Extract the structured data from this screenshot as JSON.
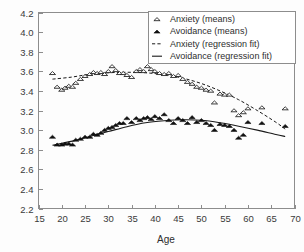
{
  "chart_data": {
    "type": "scatter",
    "title": "",
    "xlabel": "Age",
    "ylabel": "",
    "xlim": [
      15,
      70
    ],
    "ylim": [
      2.2,
      4.2
    ],
    "xticks": [
      15,
      20,
      25,
      30,
      35,
      40,
      45,
      50,
      55,
      60,
      65,
      70
    ],
    "xtick_labels": [
      "15",
      "20",
      "25",
      "30",
      "35",
      "40",
      "45",
      "50",
      "55",
      "60",
      "65",
      "70"
    ],
    "yticks": [
      2.2,
      2.4,
      2.6,
      2.8,
      3.0,
      3.2,
      3.4,
      3.6,
      3.8,
      4.0,
      4.2
    ],
    "ytick_labels": [
      "2.2",
      "2.4",
      "2.6",
      "2.8",
      "3.0",
      "3.2",
      "3.4",
      "3.6",
      "3.8",
      "4.0",
      "4.2"
    ],
    "grid": false,
    "legend_position": "top-right",
    "series": [
      {
        "name": "Anxiety (means)",
        "marker": "open-triangle",
        "style": "markers",
        "x": [
          18,
          19,
          20,
          20.7,
          21.5,
          22.3,
          23,
          24,
          25,
          26,
          26.8,
          27.6,
          28.4,
          29.2,
          30,
          30.8,
          31.6,
          32.4,
          33.2,
          34,
          35,
          36,
          36.8,
          37.6,
          38.4,
          39.2,
          40,
          41,
          42,
          43,
          44,
          45,
          46,
          47,
          48,
          49,
          50,
          51,
          52,
          52.8,
          54,
          55,
          56,
          57,
          58,
          59,
          60,
          63,
          68
        ],
        "y": [
          3.58,
          3.44,
          3.41,
          3.43,
          3.45,
          3.44,
          3.48,
          3.52,
          3.55,
          3.57,
          3.59,
          3.58,
          3.59,
          3.57,
          3.6,
          3.65,
          3.61,
          3.58,
          3.58,
          3.56,
          3.54,
          3.6,
          3.62,
          3.6,
          3.65,
          3.62,
          3.6,
          3.58,
          3.57,
          3.58,
          3.55,
          3.56,
          3.52,
          3.49,
          3.47,
          3.44,
          3.43,
          3.41,
          3.4,
          3.28,
          3.37,
          3.36,
          3.36,
          3.2,
          3.15,
          3.18,
          3.22,
          3.23,
          3.22
        ]
      },
      {
        "name": "Avoidance (means)",
        "marker": "filled-triangle",
        "style": "markers",
        "x": [
          18,
          19,
          20,
          20.7,
          21.5,
          22.3,
          23,
          24,
          25,
          26,
          26.8,
          27.6,
          28.4,
          29.2,
          30,
          30.8,
          31.6,
          32.4,
          33.2,
          34,
          35,
          36,
          36.8,
          37.6,
          38.4,
          39.2,
          40,
          41,
          42,
          43,
          44,
          45,
          46,
          47,
          48,
          49,
          50,
          51,
          52,
          52.8,
          54,
          55,
          56,
          57,
          58,
          59,
          60,
          63,
          68
        ],
        "y": [
          2.93,
          2.85,
          2.85,
          2.86,
          2.86,
          2.85,
          2.9,
          2.91,
          2.93,
          2.93,
          2.96,
          2.95,
          2.97,
          3.0,
          3.02,
          3.03,
          3.05,
          3.07,
          3.07,
          3.12,
          3.08,
          3.12,
          3.1,
          3.12,
          3.13,
          3.11,
          3.14,
          3.12,
          3.16,
          3.1,
          3.07,
          3.12,
          3.1,
          3.07,
          3.13,
          3.08,
          3.1,
          3.07,
          3.05,
          3.0,
          3.06,
          3.05,
          3.04,
          3.0,
          2.92,
          2.95,
          3.08,
          3.07,
          3.04
        ]
      },
      {
        "name": "Anxiety (regression fit)",
        "style": "dashed-line",
        "x": [
          18,
          22,
          26,
          30,
          34,
          38,
          42,
          46,
          50,
          54,
          58,
          62,
          66,
          68
        ],
        "y": [
          3.52,
          3.54,
          3.57,
          3.585,
          3.59,
          3.585,
          3.565,
          3.53,
          3.475,
          3.4,
          3.31,
          3.2,
          3.08,
          3.01
        ]
      },
      {
        "name": "Avoidance (regression fit)",
        "style": "solid-line",
        "x": [
          18,
          22,
          26,
          30,
          34,
          38,
          42,
          46,
          50,
          54,
          58,
          62,
          66,
          68
        ],
        "y": [
          2.845,
          2.885,
          2.935,
          2.985,
          3.035,
          3.075,
          3.095,
          3.105,
          3.1,
          3.075,
          3.04,
          3.0,
          2.955,
          2.935
        ]
      }
    ]
  },
  "legend": {
    "entries": [
      {
        "label": "Anxiety (means)",
        "symbol": "open-triangle"
      },
      {
        "label": "Avoidance (means)",
        "symbol": "filled-triangle"
      },
      {
        "label": "Anxiety (regression fit)",
        "symbol": "dashed-line"
      },
      {
        "label": "Avoidance (regression fit)",
        "symbol": "solid-line"
      }
    ]
  },
  "colors": {
    "marker_fill_open": "#ffffff",
    "marker_fill_solid": "#101010",
    "marker_stroke": "#1a1a1a",
    "axis": "#8d8d8d",
    "text": "#2e2e2e",
    "background": "#fdfdfd"
  }
}
